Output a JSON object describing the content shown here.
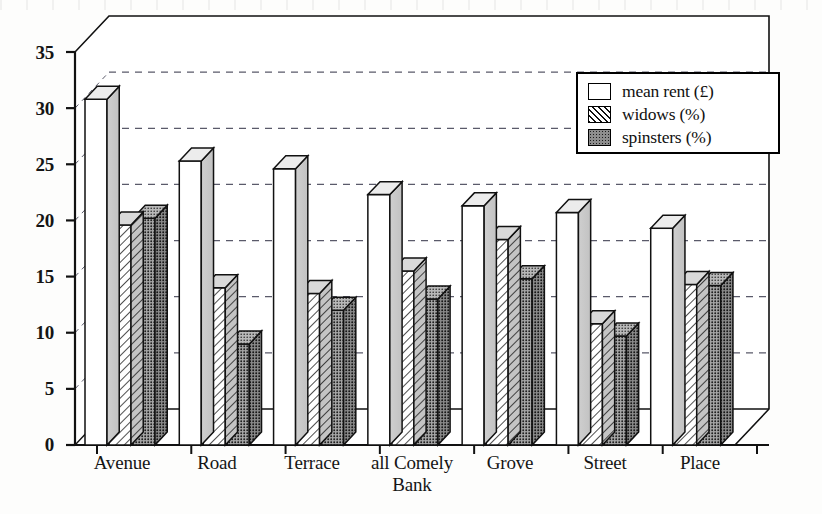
{
  "chart_data": {
    "type": "bar",
    "title": "",
    "subtitle": "",
    "xlabel": "",
    "ylabel": "",
    "ylim": [
      0,
      35
    ],
    "yticks": [
      0,
      5,
      10,
      15,
      20,
      25,
      30,
      35
    ],
    "grid": true,
    "grid_style": "dashed-horizontal",
    "legend_position": "top-right",
    "style": "3d-grouped-bars",
    "categories": [
      "Avenue",
      "Road",
      "Terrace",
      "all Comely Bank",
      "Grove",
      "Street",
      "Place"
    ],
    "category_label_lines": [
      [
        "Avenue"
      ],
      [
        "Road"
      ],
      [
        "Terrace"
      ],
      [
        "all Comely",
        "Bank"
      ],
      [
        "Grove"
      ],
      [
        "Street"
      ],
      [
        "Place"
      ]
    ],
    "series": [
      {
        "name": "mean rent (£)",
        "fill": "white",
        "values": [
          30.8,
          25.3,
          24.6,
          22.3,
          21.3,
          20.7,
          19.3
        ]
      },
      {
        "name": "widows (%)",
        "fill": "diagonal-hatch",
        "values": [
          19.6,
          14.0,
          13.5,
          15.5,
          18.3,
          10.8,
          14.3
        ]
      },
      {
        "name": "spinsters (%)",
        "fill": "stipple-dots",
        "values": [
          20.2,
          9.0,
          12.0,
          13.0,
          14.8,
          9.7,
          14.2
        ]
      }
    ]
  },
  "legend": {
    "items": [
      {
        "label": "mean rent (£)",
        "swatch": "sw-white"
      },
      {
        "label": "widows (%)",
        "swatch": "sw-hatch"
      },
      {
        "label": "spinsters (%)",
        "swatch": "sw-dots"
      }
    ]
  },
  "axis": {
    "y_tick_labels": [
      "35",
      "30",
      "25",
      "20",
      "15",
      "10",
      "5",
      "0"
    ]
  },
  "colors": {
    "ink": "#111111",
    "paper": "#fdfdfc",
    "gridline": "#5a5a6a",
    "bar_side": "#c9c9c9",
    "bar_top": "#d8d8d8",
    "spinster_face": "#9a9a9a"
  }
}
